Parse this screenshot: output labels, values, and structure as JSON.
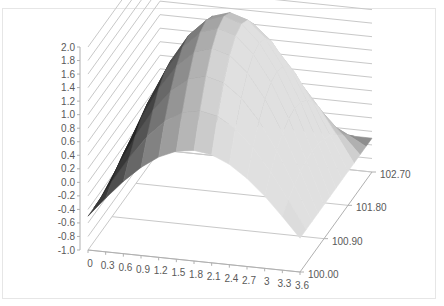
{
  "chart_data": {
    "type": "surface3d",
    "title": "",
    "z_axis": {
      "ticks": [
        "2.0",
        "1.8",
        "1.6",
        "1.4",
        "1.2",
        "1.0",
        "0.8",
        "0.6",
        "0.4",
        "0.2",
        "0.0",
        "-0.2",
        "-0.4",
        "-0.6",
        "-0.8",
        "-1.0"
      ],
      "range": [
        -1.0,
        2.0
      ]
    },
    "x_axis": {
      "ticks": [
        "0",
        "0.3",
        "0.6",
        "0.9",
        "1.2",
        "1.5",
        "1.8",
        "2.1",
        "2.4",
        "2.7",
        "3",
        "3.3",
        "3.6"
      ]
    },
    "y_axis": {
      "ticks": [
        "100.00",
        "100.90",
        "101.80",
        "102.70"
      ]
    },
    "grid": true,
    "legend": "none",
    "colors": {
      "surface_dark": "#2e2e2e",
      "surface_light": "#d8d8d8",
      "grid": "#c8c8c8",
      "text": "#595959"
    }
  }
}
